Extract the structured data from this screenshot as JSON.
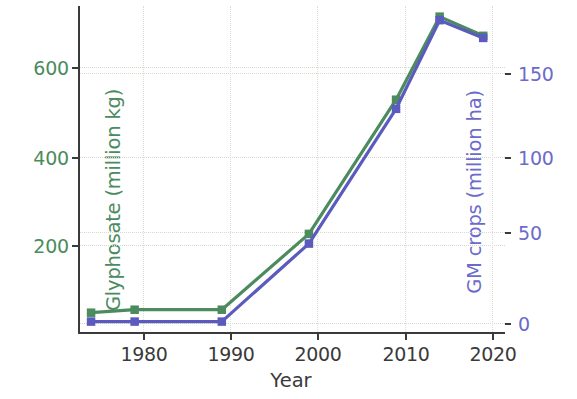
{
  "chart_data": {
    "type": "line",
    "title": "",
    "xlabel": "Year",
    "x": [
      1975,
      1980,
      1990,
      2000,
      2010,
      2015,
      2020
    ],
    "xlim": [
      1973.5,
      2022.5
    ],
    "xticks": [
      1980,
      1990,
      2000,
      2010,
      2020
    ],
    "xticklabels": [
      "1980",
      "1990",
      "2000",
      "2010",
      "2020"
    ],
    "grid": true,
    "legend": "none",
    "series": [
      {
        "name": "Glyphosate (million kg)",
        "axis": "left",
        "color": "#4b8b5e",
        "marker": "square",
        "values": [
          20,
          27,
          27,
          205,
          520,
          715,
          670
        ]
      },
      {
        "name": "GM crops (million ha)",
        "axis": "right",
        "color": "#5b5bbf",
        "marker": "square",
        "values": [
          0,
          0,
          0,
          44,
          120,
          170,
          160
        ]
      }
    ],
    "left_axis": {
      "label": "Glyphosate (million kg)",
      "color": "#4b8b5e",
      "ticks": [
        200,
        400,
        600
      ],
      "ticklabels": [
        "200",
        "400",
        "600"
      ],
      "lim": [
        -30,
        740
      ]
    },
    "right_axis": {
      "label": "GM crops (million ha)",
      "color": "#6b6bcb",
      "ticks": [
        0,
        50,
        100,
        150
      ],
      "ticklabels": [
        "0",
        "50",
        "100",
        "150"
      ],
      "lim": [
        -7,
        178
      ]
    }
  },
  "axes": {
    "ylabel_left": "Glyphosate (million kg)",
    "ylabel_right": "GM crops (million ha)",
    "xlabel": "Year",
    "ytick_left_0": "200",
    "ytick_left_1": "400",
    "ytick_left_2": "600",
    "ytick_right_0": "0",
    "ytick_right_1": "50",
    "ytick_right_2": "100",
    "ytick_right_3": "150",
    "xtick_0": "1980",
    "xtick_1": "1990",
    "xtick_2": "2000",
    "xtick_3": "2010",
    "xtick_4": "2020"
  },
  "colors": {
    "green": "#4b8b5e",
    "blue": "#5b5bbf",
    "blue_text": "#6b6bcb",
    "axis": "#3a3a3a",
    "grid": "#d8d8d0",
    "background": "#ffffff"
  }
}
